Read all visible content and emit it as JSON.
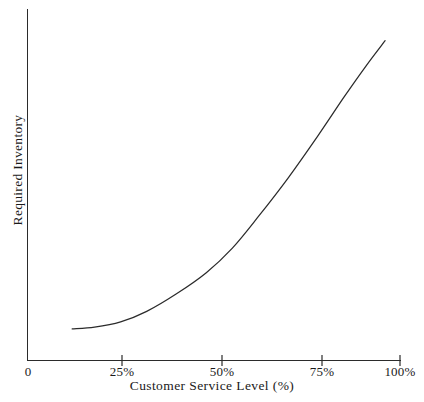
{
  "chart_data": {
    "type": "line",
    "title": "",
    "xlabel": "Customer Service Level (%)",
    "ylabel": "Required Inventory",
    "xlim": [
      0,
      100
    ],
    "ylim": [
      0,
      100
    ],
    "grid": false,
    "legend": null,
    "xticks": [
      "0",
      "25%",
      "50%",
      "75%",
      "100%"
    ],
    "xtick_values": [
      0,
      25,
      50,
      75,
      100
    ],
    "yticks": [],
    "series": [
      {
        "name": "Required Inventory",
        "x": [
          12,
          18,
          25,
          32,
          40,
          48,
          55,
          62,
          70,
          78,
          85,
          91,
          96
        ],
        "y": [
          9,
          9.5,
          11,
          14,
          19,
          25,
          32,
          41,
          52,
          64,
          75,
          84,
          91
        ]
      }
    ],
    "annotations": [],
    "line_color": "#2b2b2b",
    "axis_color": "#2b2b2b"
  },
  "axes": {
    "x_tick_0": "0",
    "x_tick_25": "25%",
    "x_tick_50": "50%",
    "x_tick_75": "75%",
    "x_tick_100": "100%",
    "x_axis_title": "Customer Service Level (%)",
    "y_axis_title": "Required Inventory"
  }
}
